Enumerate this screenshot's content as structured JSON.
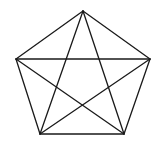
{
  "diagram": {
    "type": "pentagon-with-pentagram",
    "stroke_color": "#1a1a1a",
    "background": "#ffffff",
    "vertices": {
      "top": [
        83,
        11
      ],
      "left": [
        16,
        59
      ],
      "right": [
        150,
        59
      ],
      "bottom_left": [
        40,
        134
      ],
      "bottom_right": [
        124,
        134
      ]
    },
    "edges": [
      [
        "top",
        "right"
      ],
      [
        "right",
        "bottom_right"
      ],
      [
        "bottom_right",
        "bottom_left"
      ],
      [
        "bottom_left",
        "left"
      ],
      [
        "left",
        "top"
      ]
    ],
    "diagonals": [
      [
        "top",
        "bottom_left"
      ],
      [
        "top",
        "bottom_right"
      ],
      [
        "left",
        "right"
      ],
      [
        "left",
        "bottom_right"
      ],
      [
        "right",
        "bottom_left"
      ]
    ]
  }
}
